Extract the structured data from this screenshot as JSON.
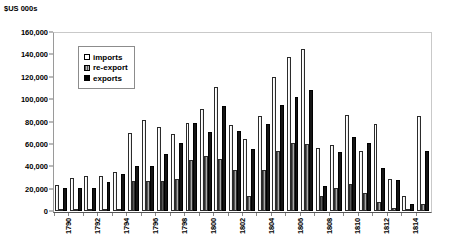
{
  "chart_data": {
    "type": "bar",
    "title": "",
    "ylabel": "$US 000s",
    "xlabel": "",
    "ylim": [
      0,
      160000
    ],
    "ytick_values": [
      0,
      20000,
      40000,
      60000,
      80000,
      100000,
      120000,
      140000,
      160000
    ],
    "ytick_labels": [
      "0",
      "20,000",
      "40,000",
      "60,000",
      "80,000",
      "100,000",
      "120,000",
      "140,000",
      "160,000"
    ],
    "grid": false,
    "legend_position": "upper-left-inside",
    "legend": [
      "imports",
      "re-export",
      "exports"
    ],
    "categories": [
      "1790",
      "1791",
      "1792",
      "1793",
      "1794",
      "1795",
      "1796",
      "1797",
      "1798",
      "1799",
      "1800",
      "1801",
      "1802",
      "1803",
      "1804",
      "1805",
      "1806",
      "1807",
      "1808",
      "1809",
      "1810",
      "1811",
      "1812",
      "1813",
      "1814",
      "1815"
    ],
    "xtick_labels_shown": [
      "1790",
      "1792",
      "1794",
      "1796",
      "1798",
      "1800",
      "1802",
      "1804",
      "1806",
      "1808",
      "1810",
      "1812",
      "1814"
    ],
    "series": [
      {
        "name": "imports",
        "color": "#ffffff",
        "values": [
          23000,
          29500,
          31500,
          31000,
          34500,
          69500,
          81500,
          75500,
          68500,
          79000,
          91000,
          111000,
          76500,
          64500,
          85000,
          120000,
          138000,
          144500,
          56500,
          59000,
          85500,
          53500,
          77500,
          28500,
          13000,
          85000
        ]
      },
      {
        "name": "re-export",
        "color": "#7d7d7d",
        "values": [
          1000,
          1200,
          1500,
          1800,
          2000,
          26500,
          26500,
          27000,
          28500,
          45500,
          49000,
          46500,
          36500,
          13500,
          36500,
          53500,
          60500,
          59500,
          13000,
          20500,
          24500,
          16500,
          8500,
          2500,
          2000,
          6000
        ]
      },
      {
        "name": "exports",
        "color": "#141414",
        "values": [
          20500,
          20500,
          20500,
          26000,
          33500,
          40500,
          40000,
          51000,
          61000,
          78500,
          70500,
          94000,
          71500,
          55500,
          77500,
          95000,
          101500,
          108500,
          22500,
          52500,
          66500,
          61000,
          38500,
          27500,
          6500,
          54000
        ]
      }
    ]
  },
  "legend_items": [
    {
      "label": "imports",
      "key": "imports"
    },
    {
      "label": "re-export",
      "key": "reexport"
    },
    {
      "label": "exports",
      "key": "exports"
    }
  ],
  "axis": {
    "y_title": "$US 000s"
  }
}
